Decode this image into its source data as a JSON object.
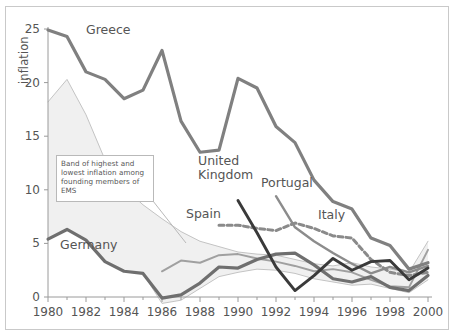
{
  "figure": {
    "name": "inflation-convergence-line-chart",
    "background": "#ffffff",
    "border_color": "#c9c9c9"
  },
  "annotation": {
    "name": "band-annotation",
    "text": "Band of highest and lowest inflation among founding members of EMS"
  },
  "chart_data": {
    "type": "line",
    "title": "",
    "xlabel": "",
    "ylabel": "inflation",
    "xlim": [
      1980,
      2000
    ],
    "ylim": [
      0,
      25
    ],
    "ytick_values": [
      0,
      5,
      10,
      15,
      20,
      25
    ],
    "ytick_labels": [
      "0",
      "5",
      "10",
      "15",
      "20",
      "25"
    ],
    "xtick_values": [
      1980,
      1982,
      1984,
      1986,
      1988,
      1990,
      1992,
      1994,
      1996,
      1998,
      2000
    ],
    "xtick_labels": [
      "1980",
      "1982",
      "1984",
      "1986",
      "1988",
      "1990",
      "1992",
      "1994",
      "1996",
      "1998",
      "2000"
    ],
    "x_minor_step": 1,
    "grid": false,
    "legend": "inline-labels",
    "x": [
      1980,
      1981,
      1982,
      1983,
      1984,
      1985,
      1986,
      1987,
      1988,
      1989,
      1990,
      1991,
      1992,
      1993,
      1994,
      1995,
      1996,
      1997,
      1998,
      1999,
      2000
    ],
    "colors": {
      "greece": "#808080",
      "portugal": "#8c8c8c",
      "italy": "#a0a0a0",
      "spain": "#8a8a8a",
      "united_kingdom": "#3a3a3a",
      "germany": "#6f6f6f",
      "band_fill": "#f0f0f0",
      "band_edge": "#bdbdbd"
    },
    "series": [
      {
        "name": "Greece",
        "label": "Greece",
        "style": "solid",
        "color": "#808080",
        "width": 3.2,
        "x": [
          1980,
          1981,
          1982,
          1983,
          1984,
          1985,
          1986,
          1987,
          1988,
          1989,
          1990,
          1991,
          1992,
          1993,
          1994,
          1995,
          1996,
          1997,
          1998,
          1999,
          2000
        ],
        "values": [
          24.9,
          24.3,
          21.0,
          20.3,
          18.5,
          19.3,
          23.0,
          16.4,
          13.5,
          13.7,
          20.4,
          19.5,
          15.9,
          14.4,
          10.9,
          8.9,
          8.2,
          5.5,
          4.8,
          2.6,
          3.2
        ]
      },
      {
        "name": "Portugal",
        "label": "Portugal",
        "style": "solid",
        "color": "#8c8c8c",
        "width": 2.4,
        "x": [
          1992,
          1993,
          1994,
          1995,
          1996,
          1997,
          1998,
          1999,
          2000
        ],
        "values": [
          9.4,
          6.5,
          5.2,
          4.1,
          3.1,
          2.2,
          2.8,
          2.3,
          2.9
        ]
      },
      {
        "name": "Italy",
        "label": "Italy",
        "style": "solid",
        "color": "#a0a0a0",
        "width": 2.0,
        "x": [
          1986,
          1987,
          1988,
          1989,
          1990,
          1991,
          1992,
          1993,
          1994,
          1995,
          1996,
          1997,
          1998,
          1999,
          2000
        ],
        "values": [
          2.4,
          3.4,
          3.2,
          3.9,
          4.0,
          3.6,
          3.3,
          2.9,
          2.4,
          2.6,
          2.3,
          1.6,
          1.0,
          0.9,
          4.4
        ]
      },
      {
        "name": "Spain",
        "label": "Spain",
        "style": "dashed",
        "color": "#8a8a8a",
        "width": 3.0,
        "x": [
          1989,
          1990,
          1991,
          1992,
          1993,
          1994,
          1995,
          1996,
          1997,
          1998,
          1999,
          2000
        ],
        "values": [
          6.7,
          6.7,
          6.4,
          6.2,
          6.9,
          6.4,
          5.7,
          5.5,
          3.5,
          2.3,
          2.0,
          2.3
        ]
      },
      {
        "name": "United Kingdom",
        "label": "United Kingdom",
        "style": "solid",
        "color": "#3a3a3a",
        "width": 2.9,
        "x": [
          1990,
          1991,
          1992,
          1993,
          1994,
          1995,
          1996,
          1997,
          1998,
          1999,
          2000
        ],
        "values": [
          9.0,
          6.0,
          2.8,
          0.6,
          2.0,
          3.6,
          2.5,
          3.3,
          3.4,
          1.6,
          2.7
        ]
      },
      {
        "name": "Germany",
        "label": "Germany",
        "style": "solid",
        "color": "#6f6f6f",
        "width": 3.2,
        "x": [
          1980,
          1981,
          1982,
          1983,
          1984,
          1985,
          1986,
          1987,
          1988,
          1989,
          1990,
          1991,
          1992,
          1993,
          1994,
          1995,
          1996,
          1997,
          1998,
          1999,
          2000
        ],
        "values": [
          5.4,
          6.3,
          5.3,
          3.3,
          2.4,
          2.2,
          -0.1,
          0.2,
          1.3,
          2.8,
          2.7,
          3.5,
          4.0,
          4.1,
          3.0,
          1.7,
          1.4,
          1.9,
          0.9,
          0.6,
          2.0
        ]
      },
      {
        "name": "band-upper",
        "label": "Band of highest inflation",
        "style": "band",
        "color": "#bdbdbd",
        "width": 0.9,
        "x": [
          1980,
          1981,
          1982,
          1983,
          1984,
          1985,
          1986,
          1987,
          1988,
          1989,
          1990,
          1991,
          1992,
          1993,
          1994,
          1995,
          1996,
          1997,
          1998,
          1999,
          2000
        ],
        "values": [
          18.2,
          20.3,
          17.0,
          12.8,
          10.2,
          8.6,
          7.3,
          6.1,
          5.2,
          4.7,
          4.2,
          4.0,
          3.9,
          3.5,
          3.1,
          2.9,
          3.2,
          2.8,
          2.6,
          2.3,
          5.2
        ]
      },
      {
        "name": "band-lower",
        "label": "Band of lowest inflation",
        "style": "band",
        "color": "#bdbdbd",
        "width": 0.9,
        "x": [
          1980,
          1981,
          1982,
          1983,
          1984,
          1985,
          1986,
          1987,
          1988,
          1989,
          1990,
          1991,
          1992,
          1993,
          1994,
          1995,
          1996,
          1997,
          1998,
          1999,
          2000
        ],
        "values": [
          5.4,
          6.3,
          5.3,
          3.3,
          2.4,
          2.2,
          -0.6,
          -0.3,
          0.8,
          1.9,
          2.3,
          2.6,
          2.5,
          2.2,
          1.7,
          1.4,
          1.1,
          1.2,
          0.8,
          0.4,
          1.6
        ]
      }
    ],
    "inline_labels": [
      {
        "name": "label-greece",
        "text": "Greece",
        "x_px": 86,
        "y_px": 34
      },
      {
        "name": "label-germany",
        "text": "Germany",
        "x_px": 60,
        "y_px": 249
      },
      {
        "name": "label-united-kingdom",
        "text": "United Kingdom",
        "x_px": 198,
        "y_px": 165
      },
      {
        "name": "label-portugal",
        "text": "Portugal",
        "x_px": 261,
        "y_px": 187
      },
      {
        "name": "label-spain",
        "text": "Spain",
        "x_px": 186,
        "y_px": 218
      },
      {
        "name": "label-italy",
        "text": "Italy",
        "x_px": 318,
        "y_px": 219
      }
    ]
  }
}
